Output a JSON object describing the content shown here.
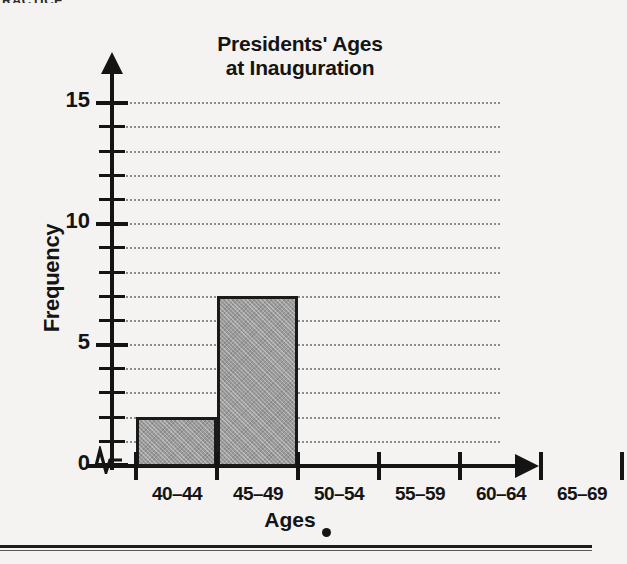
{
  "page": {
    "header_fragment": "RACTICE"
  },
  "chart_data": {
    "type": "bar",
    "title": "Presidents' Ages at Inauguration",
    "title_lines": [
      "Presidents' Ages",
      "at Inauguration"
    ],
    "xlabel": "Ages",
    "ylabel": "Frequency",
    "categories": [
      "40–44",
      "45–49",
      "50–54",
      "55–59",
      "60–64",
      "65–69"
    ],
    "values": [
      2,
      7,
      0,
      0,
      0,
      0
    ],
    "ylim": [
      0,
      16
    ],
    "y_major_ticks": [
      0,
      5,
      10,
      15
    ],
    "y_major_labels": [
      "0",
      "5",
      "10",
      "15"
    ],
    "y_minor_tick_step": 1,
    "grid": "horizontal-dotted",
    "legend": "none",
    "axis_break": "x-axis-origin-zigzag",
    "bar_fill_color": "#9b9b9b",
    "bar_edge_color": "#1a1a1a",
    "gridline_color": "#8d8d8d",
    "axis_color": "#141414"
  }
}
